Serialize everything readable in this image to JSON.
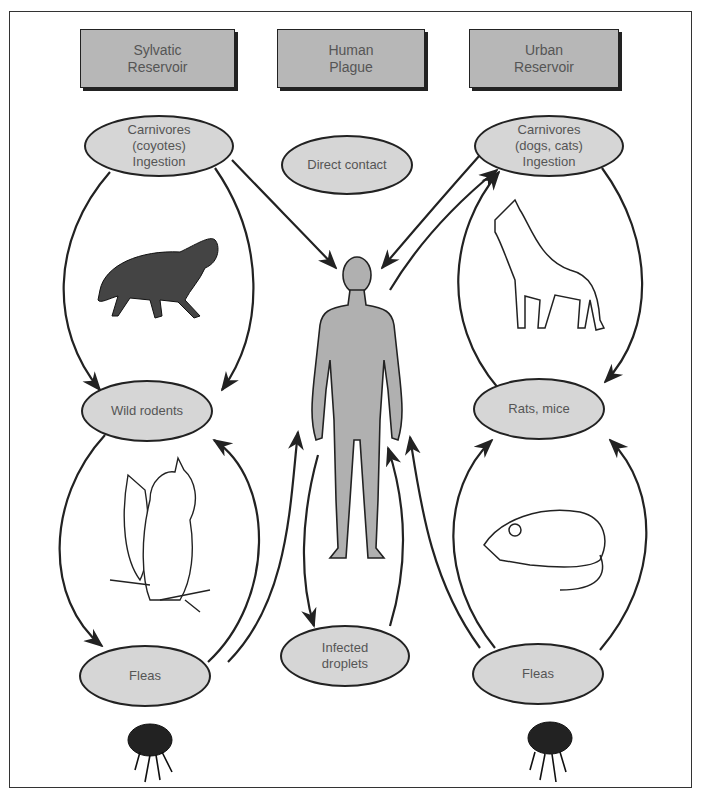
{
  "headers": {
    "sylvatic": "Sylvatic\nReservoir",
    "human": "Human\nPlague",
    "urban": "Urban\nReservoir"
  },
  "nodes": {
    "carnivores_sylvatic": "Carnivores\n(coyotes)\nIngestion",
    "direct_contact": "Direct contact",
    "carnivores_urban": "Carnivores\n(dogs, cats)\nIngestion",
    "wild_rodents": "Wild rodents",
    "rats_mice": "Rats, mice",
    "fleas_sylvatic": "Fleas",
    "infected_droplets": "Infected\ndroplets",
    "fleas_urban": "Fleas"
  },
  "illustrations": [
    "coyote",
    "squirrel",
    "flea",
    "human-figure",
    "dog",
    "rat",
    "flea"
  ],
  "edges": [
    {
      "from": "Carnivores (coyotes)",
      "to": "Wild rodents"
    },
    {
      "from": "Wild rodents",
      "to": "Carnivores (coyotes)"
    },
    {
      "from": "Carnivores (coyotes)",
      "to": "Human"
    },
    {
      "from": "Wild rodents",
      "to": "Fleas (sylvatic)"
    },
    {
      "from": "Fleas (sylvatic)",
      "to": "Wild rodents"
    },
    {
      "from": "Fleas (sylvatic)",
      "to": "Human"
    },
    {
      "from": "Human",
      "to": "Infected droplets"
    },
    {
      "from": "Infected droplets",
      "to": "Human"
    },
    {
      "from": "Fleas (urban)",
      "to": "Human"
    },
    {
      "from": "Human",
      "to": "Carnivores (dogs, cats)"
    },
    {
      "from": "Carnivores (dogs, cats)",
      "to": "Human"
    },
    {
      "from": "Carnivores (dogs, cats)",
      "to": "Rats, mice"
    },
    {
      "from": "Rats, mice",
      "to": "Carnivores (dogs, cats)"
    },
    {
      "from": "Fleas (urban)",
      "to": "Rats, mice"
    },
    {
      "from": "Rats, mice",
      "to": "Fleas (urban)"
    }
  ],
  "colors": {
    "box_fill": "#b7b7b7",
    "node_fill": "#d6d6d6",
    "figure_fill": "#b0b0b0",
    "stroke": "#222222"
  }
}
